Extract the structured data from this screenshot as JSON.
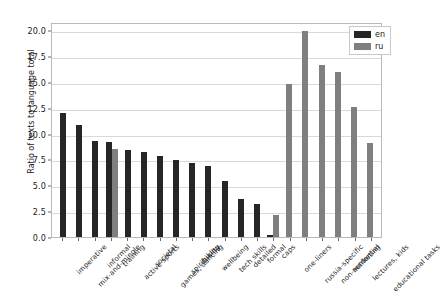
{
  "chart_data": {
    "type": "bar",
    "title": "",
    "xlabel": "",
    "ylabel": "Ratio of texts to language total",
    "ylim": [
      0,
      20.8
    ],
    "yticks": [
      0.0,
      2.5,
      5.0,
      7.5,
      10.0,
      12.5,
      15.0,
      17.5,
      20.0
    ],
    "ytick_labels": [
      "0.0",
      "2.5",
      "5.0",
      "7.5",
      "10.0",
      "12.5",
      "15.0",
      "17.5",
      "20.0"
    ],
    "grid": true,
    "legend_position": "upper right",
    "legend": [
      "en",
      "ru"
    ],
    "colors": {
      "en": "#262626",
      "ru": "#7f7f7f"
    },
    "categories": [
      "imperative",
      "mix-and-mingle",
      "informal",
      "training",
      "active sports",
      "societal",
      "games, dancing",
      "spirituality",
      "hiking",
      "wellbeing",
      "tech skills",
      "detailed",
      "formal",
      "caps",
      "one-liners",
      "russia-specific",
      "non-sentential",
      "marketing",
      "lectures, kids",
      "educational tasks"
    ],
    "series": [
      {
        "name": "en",
        "values": [
          12.0,
          10.8,
          9.3,
          9.2,
          8.4,
          8.25,
          7.85,
          7.45,
          7.2,
          6.9,
          5.4,
          3.7,
          3.15,
          0.2,
          null,
          null,
          null,
          null,
          null,
          null
        ]
      },
      {
        "name": "ru",
        "values": [
          null,
          null,
          null,
          8.5,
          null,
          null,
          null,
          null,
          null,
          null,
          null,
          null,
          null,
          2.1,
          14.8,
          19.9,
          16.6,
          16.0,
          12.55,
          9.1
        ]
      }
    ]
  }
}
